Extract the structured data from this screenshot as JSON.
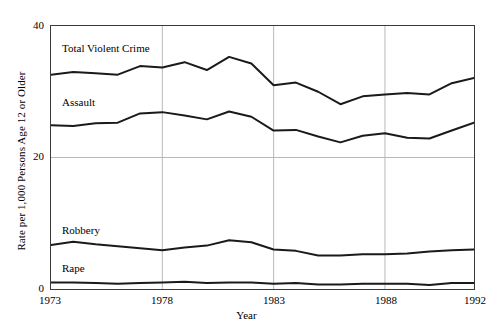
{
  "chart_data": {
    "type": "line",
    "title": "",
    "xlabel": "Year",
    "ylabel": "Rate per 1,000 Persons Age 12 or Older",
    "xlim": [
      1973,
      1992
    ],
    "ylim": [
      0,
      40
    ],
    "xticks": [
      1973,
      1978,
      1983,
      1988,
      1992
    ],
    "xtick_labels": [
      "1973",
      "1978",
      "1983",
      "1988",
      "1992"
    ],
    "yticks": [
      0,
      20,
      40
    ],
    "ytick_labels": [
      "0",
      "20",
      "40"
    ],
    "grid": "vertical-and-horizontal-light",
    "legend": "inline-labels",
    "line_color": "#1a1a1a",
    "grid_color": "#b9b9b9",
    "axis_color": "#3a3a3a",
    "x": [
      1973,
      1974,
      1975,
      1976,
      1977,
      1978,
      1979,
      1980,
      1981,
      1982,
      1983,
      1984,
      1985,
      1986,
      1987,
      1988,
      1989,
      1990,
      1991,
      1992
    ],
    "series": [
      {
        "name": "Total Violent Crime",
        "values": [
          32.6,
          33.0,
          32.8,
          32.6,
          33.9,
          33.7,
          34.5,
          33.3,
          35.3,
          34.3,
          31.0,
          31.4,
          30.0,
          28.1,
          29.3,
          29.6,
          29.8,
          29.6,
          31.3,
          32.1
        ]
      },
      {
        "name": "Assault",
        "values": [
          24.9,
          24.8,
          25.2,
          25.3,
          26.7,
          26.9,
          26.4,
          25.8,
          27.0,
          26.2,
          24.1,
          24.2,
          23.2,
          22.3,
          23.3,
          23.7,
          23.0,
          22.9,
          24.1,
          25.3
        ]
      },
      {
        "name": "Robbery",
        "values": [
          6.7,
          7.2,
          6.8,
          6.5,
          6.2,
          5.9,
          6.3,
          6.6,
          7.4,
          7.1,
          6.0,
          5.8,
          5.1,
          5.1,
          5.3,
          5.3,
          5.4,
          5.7,
          5.9,
          6.0
        ]
      },
      {
        "name": "Rape",
        "values": [
          1.0,
          1.0,
          0.9,
          0.8,
          0.9,
          1.0,
          1.1,
          0.9,
          1.0,
          1.0,
          0.8,
          0.9,
          0.7,
          0.7,
          0.8,
          0.8,
          0.8,
          0.6,
          0.9,
          0.9
        ]
      }
    ]
  },
  "labels": {
    "total_violent_crime": "Total Violent Crime",
    "assault": "Assault",
    "robbery": "Robbery",
    "rape": "Rape",
    "y_axis_title": "Rate per 1,000 Persons Age 12 or Older",
    "x_axis_title": "Year",
    "ytick_40": "40",
    "ytick_20": "20",
    "ytick_0": "0",
    "xtick_1973": "1973",
    "xtick_1978": "1978",
    "xtick_1983": "1983",
    "xtick_1988": "1988",
    "xtick_1992": "1992"
  }
}
